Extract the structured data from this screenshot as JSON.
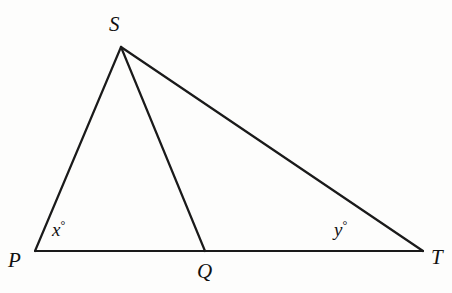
{
  "figure": {
    "type": "geometry-diagram",
    "background_color": "#fdfdfc",
    "stroke_color": "#1a1a1a",
    "stroke_width": 2.2,
    "points": {
      "P": {
        "x": 35,
        "y": 251
      },
      "S": {
        "x": 121,
        "y": 47
      },
      "Q": {
        "x": 205,
        "y": 251
      },
      "T": {
        "x": 423,
        "y": 251
      }
    },
    "segments": [
      {
        "name": "PS",
        "from": "P",
        "to": "S"
      },
      {
        "name": "ST",
        "from": "S",
        "to": "T"
      },
      {
        "name": "SQ",
        "from": "S",
        "to": "Q"
      },
      {
        "name": "PT",
        "from": "P",
        "to": "T"
      }
    ],
    "vertex_labels": [
      {
        "id": "P",
        "text": "P"
      },
      {
        "id": "S",
        "text": "S"
      },
      {
        "id": "Q",
        "text": "Q"
      },
      {
        "id": "T",
        "text": "T"
      }
    ],
    "angle_labels": [
      {
        "id": "x",
        "variable": "x",
        "degree_symbol": "°",
        "at_vertex": "P"
      },
      {
        "id": "y",
        "variable": "y",
        "degree_symbol": "°",
        "at_vertex": "T"
      }
    ]
  }
}
